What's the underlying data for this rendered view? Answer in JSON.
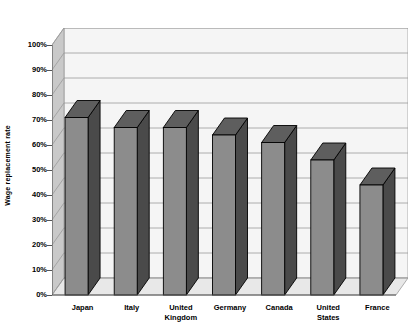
{
  "chart_data": {
    "type": "bar",
    "title": "",
    "xlabel": "",
    "ylabel": "Wage replacement rate",
    "categories": [
      "Japan",
      "Italy",
      "United Kingdom",
      "Germany",
      "Canada",
      "United States",
      "France"
    ],
    "values": [
      71,
      67,
      67,
      64,
      61,
      54,
      44
    ],
    "ylim": [
      0,
      100
    ],
    "ytick_labels": [
      "0%",
      "10%",
      "20%",
      "30%",
      "40%",
      "50%",
      "60%",
      "70%",
      "80%",
      "90%",
      "100%"
    ],
    "ytick_values": [
      0,
      10,
      20,
      30,
      40,
      50,
      60,
      70,
      80,
      90,
      100
    ],
    "grid": true,
    "legend": "none",
    "style": "3d-column",
    "colors": {
      "bar_front": "#8c8c8c",
      "bar_side": "#4a4a4a",
      "bar_top": "#5e5e5e",
      "bar_outline": "#000000",
      "back_wall": "#f5f5f5",
      "side_wall": "#c9c9c9",
      "floor": "#e8e8e8",
      "gridline": "#9a9a9a",
      "axis": "#555555",
      "text": "#000000"
    }
  }
}
